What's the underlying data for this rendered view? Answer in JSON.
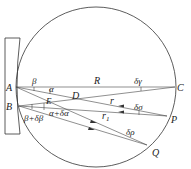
{
  "diagram": {
    "title": "",
    "circle": {
      "cx": 96,
      "cy": 87,
      "r": 80
    },
    "colors": {
      "stroke": "#333333",
      "text": "#222222",
      "background": "#ffffff"
    },
    "points": {
      "A": {
        "label": "A",
        "x": 16,
        "y": 87
      },
      "B": {
        "label": "B",
        "x": 19,
        "y": 106
      },
      "C": {
        "label": "C",
        "x": 175,
        "y": 87
      },
      "P": {
        "label": "P",
        "x": 167,
        "y": 116
      },
      "Q": {
        "label": "Q",
        "x": 147,
        "y": 145
      },
      "D": {
        "label": "D",
        "x": 75,
        "y": 93
      },
      "E": {
        "label": "E",
        "x": 48,
        "y": 98
      }
    },
    "labels": {
      "A": "A",
      "B": "B",
      "C": "C",
      "P": "P",
      "Q": "Q",
      "D": "D",
      "E": "E",
      "R": "R",
      "r": "r",
      "r1": "r",
      "r1_sub": "1",
      "beta": "β",
      "alpha": "α",
      "beta_plus": "β+δβ",
      "alpha_plus": "α+δα",
      "delta_gamma": "δγ",
      "delta_sigma": "δσ",
      "delta_rho": "δρ"
    },
    "lines": [
      {
        "from": "A",
        "to": "C"
      },
      {
        "from": "A",
        "to": "P"
      },
      {
        "from": "A",
        "to": "Q"
      },
      {
        "from": "B",
        "to": "C"
      },
      {
        "from": "B",
        "to": "P"
      },
      {
        "from": "B",
        "to": "Q"
      }
    ]
  }
}
